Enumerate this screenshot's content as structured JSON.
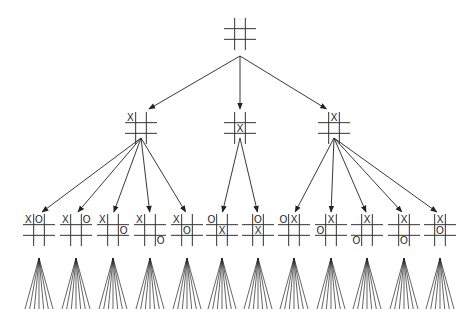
{
  "colors": {
    "line": "#222222",
    "background": "#ffffff"
  },
  "board_size": 32,
  "root": {
    "id": "root",
    "cx": 240,
    "cy": 34,
    "cells": [
      "",
      "",
      "",
      "",
      "",
      "",
      "",
      "",
      ""
    ]
  },
  "level1": [
    {
      "id": "x-corner",
      "cx": 141,
      "cy": 128,
      "cells": [
        "X",
        "",
        "",
        "",
        "",
        "",
        "",
        "",
        ""
      ]
    },
    {
      "id": "x-center",
      "cx": 240,
      "cy": 128,
      "cells": [
        "",
        "",
        "",
        "",
        "X",
        "",
        "",
        "",
        ""
      ]
    },
    {
      "id": "x-edge",
      "cx": 334,
      "cy": 128,
      "cells": [
        "",
        "X",
        "",
        "",
        "",
        "",
        "",
        "",
        ""
      ]
    }
  ],
  "level2": [
    {
      "parent": 0,
      "cx": 39,
      "cy": 230,
      "cells": [
        "X",
        "O",
        "",
        "",
        "",
        "",
        "",
        "",
        ""
      ]
    },
    {
      "parent": 0,
      "cx": 76,
      "cy": 230,
      "cells": [
        "X",
        "",
        "O",
        "",
        "",
        "",
        "",
        "",
        ""
      ]
    },
    {
      "parent": 0,
      "cx": 113,
      "cy": 230,
      "cells": [
        "X",
        "",
        "",
        "",
        "",
        "O",
        "",
        "",
        ""
      ]
    },
    {
      "parent": 0,
      "cx": 150,
      "cy": 230,
      "cells": [
        "X",
        "",
        "",
        "",
        "",
        "",
        "",
        "",
        "O"
      ]
    },
    {
      "parent": 0,
      "cx": 187,
      "cy": 230,
      "cells": [
        "X",
        "",
        "",
        "",
        "O",
        "",
        "",
        "",
        ""
      ]
    },
    {
      "parent": 1,
      "cx": 222,
      "cy": 230,
      "cells": [
        "O",
        "",
        "",
        "",
        "X",
        "",
        "",
        "",
        ""
      ]
    },
    {
      "parent": 1,
      "cx": 258,
      "cy": 230,
      "cells": [
        "",
        "O",
        "",
        "",
        "X",
        "",
        "",
        "",
        ""
      ]
    },
    {
      "parent": 2,
      "cx": 294,
      "cy": 230,
      "cells": [
        "O",
        "X",
        "",
        "",
        "",
        "",
        "",
        "",
        ""
      ]
    },
    {
      "parent": 2,
      "cx": 331,
      "cy": 230,
      "cells": [
        "",
        "X",
        "",
        "O",
        "",
        "",
        "",
        "",
        ""
      ]
    },
    {
      "parent": 2,
      "cx": 367,
      "cy": 230,
      "cells": [
        "",
        "X",
        "",
        "",
        "",
        "",
        "O",
        "",
        ""
      ]
    },
    {
      "parent": 2,
      "cx": 404,
      "cy": 230,
      "cells": [
        "",
        "X",
        "",
        "",
        "",
        "",
        "",
        "O",
        ""
      ]
    },
    {
      "parent": 2,
      "cx": 440,
      "cy": 230,
      "cells": [
        "",
        "X",
        "",
        "",
        "O",
        "",
        "",
        "",
        ""
      ]
    }
  ],
  "fan": {
    "apex_dy": 28,
    "bottom_y": 309,
    "spread": 14,
    "lines": 7
  }
}
